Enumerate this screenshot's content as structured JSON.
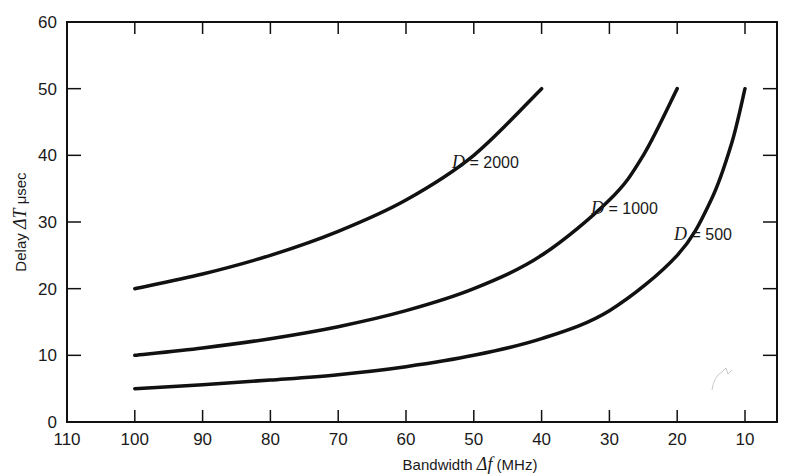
{
  "chart_data": {
    "type": "line",
    "title": "",
    "xlabel": "Bandwidth Δf (MHz)",
    "ylabel": "Delay ΔT μsec",
    "xlim": [
      110,
      0
    ],
    "ylim": [
      0,
      60
    ],
    "x_reversed": true,
    "x_ticks": [
      110,
      100,
      90,
      80,
      70,
      60,
      50,
      40,
      30,
      20,
      10
    ],
    "y_ticks": [
      0,
      10,
      20,
      30,
      40,
      50,
      60
    ],
    "grid": false,
    "legend": "inline curve labels",
    "series": [
      {
        "name": "D = 2000",
        "x": [
          100,
          90,
          80,
          70,
          60,
          50,
          40
        ],
        "y": [
          20,
          22.2,
          25,
          28.6,
          33.3,
          40,
          50
        ]
      },
      {
        "name": "D = 1000",
        "x": [
          100,
          90,
          80,
          70,
          60,
          50,
          40,
          30,
          25,
          20
        ],
        "y": [
          10,
          11.1,
          12.5,
          14.3,
          16.7,
          20,
          25,
          33.3,
          40,
          50
        ]
      },
      {
        "name": "D = 500",
        "x": [
          100,
          90,
          80,
          70,
          60,
          50,
          40,
          30,
          20,
          15,
          12,
          10
        ],
        "y": [
          5,
          5.6,
          6.3,
          7.1,
          8.3,
          10,
          12.5,
          16.7,
          25,
          33.3,
          41.7,
          50
        ]
      }
    ],
    "annotations": [
      {
        "text": "D = 2000",
        "x": 45,
        "y": 42
      },
      {
        "text": "D = 1000",
        "x": 27,
        "y": 33
      },
      {
        "text": "D = 500",
        "x": 12,
        "y": 27
      }
    ]
  },
  "axes": {
    "x_title_prefix": "Bandwidth ",
    "x_title_symbol": "Δf",
    "x_title_suffix": " (MHz)",
    "y_title_prefix": "Delay ",
    "y_title_symbol": "ΔT",
    "y_title_suffix": " μsec"
  },
  "labels": {
    "d2000": {
      "symbol": "D",
      "rest": " = 2000"
    },
    "d1000": {
      "symbol": "D",
      "rest": " = 1000"
    },
    "d500": {
      "symbol": "D",
      "rest": " = 500"
    }
  },
  "style": {
    "line_color": "#111111",
    "background": "#ffffff"
  }
}
